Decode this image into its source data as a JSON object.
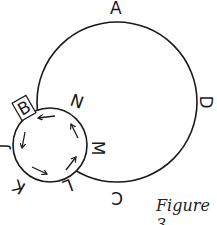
{
  "figure": {
    "caption": "Figure 3",
    "large_circle": {
      "labels": {
        "top": "A",
        "right": "D",
        "bottom": "C"
      }
    },
    "small_circle": {
      "boxed_label": "B",
      "labels": {
        "top_right": "N",
        "right": "M",
        "bottom": "L",
        "bottom_left": "K",
        "left": "J"
      },
      "arrow_direction": "counterclockwise",
      "arrow_count": 5
    },
    "stroke_color": "#1a1a1a"
  }
}
